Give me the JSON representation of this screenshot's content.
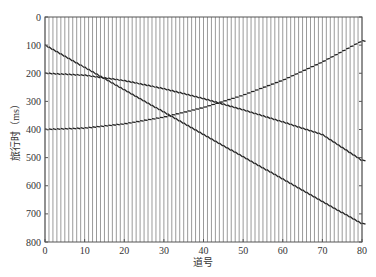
{
  "chart_data": {
    "type": "line",
    "title": "",
    "xlabel": "道号",
    "ylabel": "旅行时（ms）",
    "xlim": [
      0,
      80
    ],
    "ylim": [
      0,
      800
    ],
    "y_inverted": true,
    "grid": false,
    "xticks": [
      0,
      10,
      20,
      30,
      40,
      50,
      60,
      70,
      80
    ],
    "yticks": [
      0,
      100,
      200,
      300,
      400,
      500,
      600,
      700,
      800
    ],
    "traces": {
      "count": 81,
      "first": 0,
      "last": 80,
      "color": "#9a9a9a"
    },
    "series": [
      {
        "name": "direct-linear-event",
        "x": [
          0,
          10,
          20,
          30,
          40,
          50,
          60,
          70,
          80
        ],
        "values": [
          100,
          179,
          259,
          338,
          418,
          497,
          576,
          656,
          735
        ]
      },
      {
        "name": "hyperbola-apex-left",
        "x": [
          0,
          10,
          20,
          30,
          40,
          50,
          60,
          70,
          80
        ],
        "values": [
          200,
          207,
          226,
          255,
          290,
          330,
          373,
          418,
          510
        ]
      },
      {
        "name": "hyperbola-apex-right",
        "x": [
          0,
          10,
          20,
          30,
          40,
          50,
          60,
          70,
          80
        ],
        "values": [
          400,
          395,
          380,
          356,
          322,
          278,
          225,
          160,
          85
        ]
      }
    ],
    "line_color": "#222222"
  }
}
